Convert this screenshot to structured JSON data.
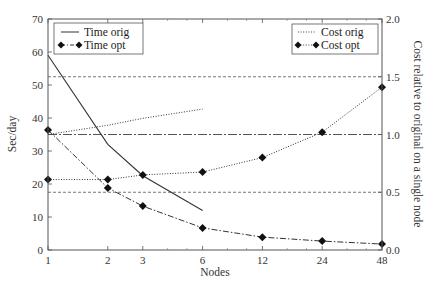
{
  "chart_data": {
    "type": "line",
    "title": "",
    "xlabel": "Nodes",
    "ylabel_left": "Sec/day",
    "ylabel_right": "Cost relative to original on a single node",
    "x_scale": "log2",
    "x": [
      1,
      2,
      3,
      6,
      12,
      24,
      48
    ],
    "x_tick_labels": [
      "1",
      "2",
      "3",
      "6",
      "12",
      "24",
      "48"
    ],
    "ylim_left": [
      0,
      70
    ],
    "y_ticks_left": [
      0,
      10,
      20,
      30,
      40,
      50,
      60,
      70
    ],
    "ylim_right": [
      0,
      2.0
    ],
    "y_ticks_right": [
      "0.0",
      "0.5",
      "1.0",
      "1.5",
      "2.0"
    ],
    "grid": false,
    "reference_lines_right_axis": [
      {
        "value": 1.5,
        "style": "dashed"
      },
      {
        "value": 1.0,
        "style": "dash-dot"
      },
      {
        "value": 0.5,
        "style": "dashed"
      }
    ],
    "series": [
      {
        "name": "Time orig",
        "axis": "left",
        "style": "solid",
        "marker": "none",
        "x": [
          1,
          2,
          3,
          6
        ],
        "values": [
          59,
          32,
          22.5,
          12
        ]
      },
      {
        "name": "Time opt",
        "axis": "left",
        "style": "dash-dot",
        "marker": "diamond",
        "x": [
          1,
          2,
          3,
          6,
          12,
          24,
          48
        ],
        "values": [
          36.4,
          18.8,
          13.3,
          6.7,
          3.9,
          2.7,
          1.8
        ]
      },
      {
        "name": "Cost orig",
        "axis": "right",
        "style": "dotted",
        "marker": "none",
        "x": [
          1,
          2,
          3,
          6
        ],
        "values": [
          1.0,
          1.08,
          1.14,
          1.22
        ]
      },
      {
        "name": "Cost opt",
        "axis": "right",
        "style": "dotted",
        "marker": "diamond",
        "x": [
          1,
          2,
          3,
          6,
          12,
          24,
          48
        ],
        "values": [
          0.61,
          0.61,
          0.65,
          0.675,
          0.8,
          1.02,
          1.41
        ]
      }
    ],
    "legends": [
      {
        "position": "upper left",
        "entries": [
          "Time orig",
          "Time opt"
        ]
      },
      {
        "position": "upper right",
        "entries": [
          "Cost orig",
          "Cost opt"
        ]
      }
    ]
  },
  "labels": {
    "xlabel": "Nodes",
    "ylabel_left": "Sec/day",
    "ylabel_right": "Cost relative to original on a single node",
    "legend_left": [
      "Time orig",
      "Time opt"
    ],
    "legend_right": [
      "Cost orig",
      "Cost opt"
    ]
  }
}
